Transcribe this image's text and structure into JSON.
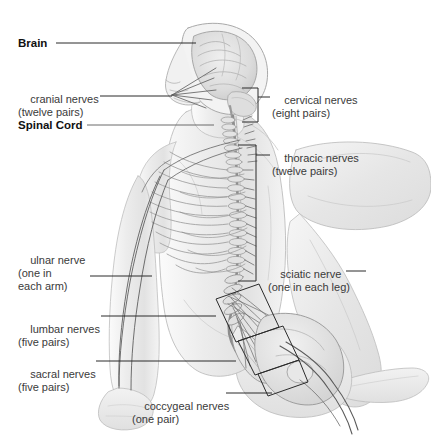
{
  "figure": {
    "background_color": "#ffffff",
    "line_color": "#2b2b2b",
    "body_tone": "#ededed"
  },
  "labels": [
    {
      "id": "brain",
      "name": "label-brain",
      "line1": "Brain",
      "line2": "",
      "style": "bold",
      "x": 18,
      "y": 37,
      "leader": {
        "x1": 56,
        "y1": 43,
        "x2": 196,
        "y2": 43
      }
    },
    {
      "id": "cranial-nerves",
      "name": "label-cranial-nerves",
      "line1": "cranial nerves",
      "line2": "(twelve pairs)",
      "style": "regular",
      "x": 18,
      "y": 80,
      "leader": {
        "x1": 100,
        "y1": 96,
        "x2": 172,
        "y2": 96
      }
    },
    {
      "id": "spinal-cord",
      "name": "label-spinal-cord",
      "line1": "Spinal Cord",
      "line2": "",
      "style": "bold",
      "x": 18,
      "y": 119,
      "leader": {
        "x1": 87,
        "y1": 125,
        "x2": 214,
        "y2": 125
      }
    },
    {
      "id": "ulnar-nerve",
      "name": "label-ulnar-nerve",
      "line1": "ulnar nerve",
      "line2": "(one in",
      "line3": "each arm)",
      "style": "regular",
      "x": 18,
      "y": 241,
      "leader": {
        "x1": 90,
        "y1": 276,
        "x2": 152,
        "y2": 276
      }
    },
    {
      "id": "lumbar-nerves",
      "name": "label-lumbar-nerves",
      "line1": "lumbar nerves",
      "line2": "(five pairs)",
      "style": "regular",
      "x": 18,
      "y": 310,
      "leader": {
        "x1": 101,
        "y1": 316,
        "x2": 216,
        "y2": 316
      }
    },
    {
      "id": "sacral-nerves",
      "name": "label-sacral-nerves",
      "line1": "sacral nerves",
      "line2": "(five pairs)",
      "style": "regular",
      "x": 18,
      "y": 355,
      "leader": {
        "x1": 96,
        "y1": 361,
        "x2": 236,
        "y2": 361
      }
    },
    {
      "id": "coccygeal-nerves",
      "name": "label-coccygeal-nerves",
      "line1": "coccygeal nerves",
      "line2": "(one pair)",
      "style": "regular",
      "x": 132,
      "y": 387,
      "leader": {
        "x1": 226,
        "y1": 393,
        "x2": 272,
        "y2": 393
      }
    },
    {
      "id": "cervical-nerves",
      "name": "label-cervical-nerves",
      "line1": "cervical nerves",
      "line2": "(eight pairs)",
      "style": "regular",
      "x": 272,
      "y": 81,
      "leader": {
        "x1": 258,
        "y1": 97,
        "x2": 270,
        "y2": 97
      }
    },
    {
      "id": "thoracic-nerves",
      "name": "label-thoracic-nerves",
      "line1": "thoracic nerves",
      "line2": "(twelve pairs)",
      "style": "regular",
      "x": 272,
      "y": 139,
      "leader": {
        "x1": 256,
        "y1": 155,
        "x2": 270,
        "y2": 155
      }
    },
    {
      "id": "sciatic-nerve",
      "name": "label-sciatic-nerve",
      "line1": "sciatic nerve",
      "line2": "(one in each leg)",
      "style": "regular",
      "x": 268,
      "y": 255,
      "leader": {
        "x1": 346,
        "y1": 271,
        "x2": 366,
        "y2": 271
      }
    }
  ],
  "brackets": [
    {
      "id": "cervical-bracket",
      "name": "bracket-cervical-nerves",
      "type": "square",
      "points": "242,88 258,88 258,122 242,122"
    },
    {
      "id": "thoracic-bracket",
      "name": "bracket-thoracic-nerves",
      "type": "square",
      "points": "238,145 256,145 256,281 238,281"
    },
    {
      "id": "lumbar-bracket",
      "name": "bracket-lumbar-nerves",
      "type": "parallelogram",
      "points": "216,299 259,284 279,327 236,342"
    },
    {
      "id": "sacral-bracket",
      "name": "bracket-sacral-nerves",
      "type": "parallelogram",
      "points": "238,341 283,326 299,360 255,375"
    },
    {
      "id": "coccygeal-bracket",
      "name": "bracket-coccygeal-nerves",
      "type": "parallelogram",
      "points": "258,374 299,360 308,382 268,396"
    }
  ],
  "anatomy_parts": [
    {
      "name": "brain",
      "label": "Brain"
    },
    {
      "name": "skull",
      "label": "Skull outline"
    },
    {
      "name": "face-profile",
      "label": "Face in profile"
    },
    {
      "name": "cervical-spine",
      "label": "Cervical vertebrae"
    },
    {
      "name": "thoracic-spine",
      "label": "Thoracic vertebrae with ribs"
    },
    {
      "name": "lumbar-spine",
      "label": "Lumbar vertebrae"
    },
    {
      "name": "sacrum",
      "label": "Sacrum"
    },
    {
      "name": "cauda-equina",
      "label": "Cauda equina nerve fan"
    },
    {
      "name": "pelvis",
      "label": "Pelvis"
    },
    {
      "name": "left-arm",
      "label": "Arm with ulnar nerve"
    },
    {
      "name": "thigh",
      "label": "Thigh with sciatic nerve"
    },
    {
      "name": "lower-leg",
      "label": "Lower leg"
    },
    {
      "name": "foot",
      "label": "Foot"
    }
  ]
}
